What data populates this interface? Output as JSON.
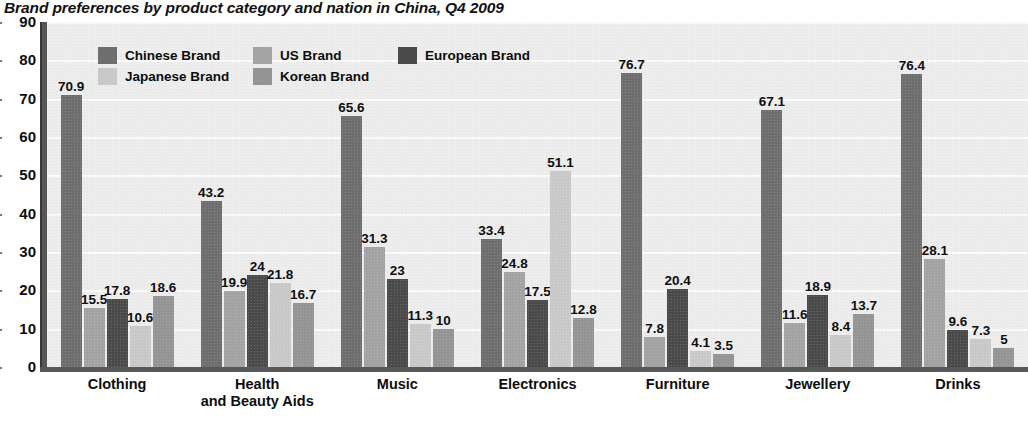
{
  "title": "Brand preferences by product category and nation in China, Q4 2009",
  "legend": {
    "items": [
      {
        "label": "Chinese Brand",
        "color": "#6e6e6e"
      },
      {
        "label": "US Brand",
        "color": "#a3a3a3"
      },
      {
        "label": "European Brand",
        "color": "#4a4a4a"
      },
      {
        "label": "Japanese Brand",
        "color": "#c9c9c9"
      },
      {
        "label": "Korean Brand",
        "color": "#949494"
      }
    ]
  },
  "axes": {
    "y_ticks": [
      "90",
      "80",
      "70",
      "60",
      "50",
      "40",
      "30",
      "20",
      "10",
      "0"
    ]
  },
  "colors": {
    "plot_background": "#ededed",
    "gridline": "#fbfbfb",
    "axis": "#585858",
    "text": "#0d0d0d"
  },
  "chart_data": {
    "type": "bar",
    "title": "Brand preferences by product category and nation in China, Q4 2009",
    "xlabel": "",
    "ylabel": "",
    "ylim": [
      0,
      90
    ],
    "ytick_step": 10,
    "grid": true,
    "legend_position": "top-left inside plot",
    "categories": [
      "Clothing",
      "Health\nand Beauty Aids",
      "Music",
      "Electronics",
      "Furniture",
      "Jewellery",
      "Drinks"
    ],
    "series": [
      {
        "name": "Chinese Brand",
        "color": "#6e6e6e",
        "values": [
          70.9,
          43.2,
          65.6,
          33.4,
          76.7,
          67.1,
          76.4
        ],
        "labels": [
          "70.9",
          "43.2",
          "65.6",
          "33.4",
          "76.7",
          "67.1",
          "76.4"
        ]
      },
      {
        "name": "US Brand",
        "color": "#a3a3a3",
        "values": [
          15.5,
          19.9,
          31.3,
          24.8,
          7.8,
          11.6,
          28.1
        ],
        "labels": [
          "15.5",
          "19.9",
          "31.3",
          "24.8",
          "7.8",
          "11.6",
          "28.1"
        ]
      },
      {
        "name": "European Brand",
        "color": "#4a4a4a",
        "values": [
          17.8,
          24,
          23,
          17.5,
          20.4,
          18.9,
          9.6
        ],
        "labels": [
          "17.8",
          "24",
          "23",
          "17.5",
          "20.4",
          "18.9",
          "9.6"
        ]
      },
      {
        "name": "Japanese Brand",
        "color": "#c9c9c9",
        "values": [
          10.6,
          21.8,
          11.3,
          51.1,
          4.1,
          8.4,
          7.3
        ],
        "labels": [
          "10.6",
          "21.8",
          "11.3",
          "51.1",
          "4.1",
          "8.4",
          "7.3"
        ]
      },
      {
        "name": "Korean Brand",
        "color": "#949494",
        "values": [
          18.6,
          16.7,
          10,
          12.8,
          3.5,
          13.7,
          5
        ],
        "labels": [
          "18.6",
          "16.7",
          "10",
          "12.8",
          "3.5",
          "13.7",
          "5"
        ]
      }
    ]
  }
}
